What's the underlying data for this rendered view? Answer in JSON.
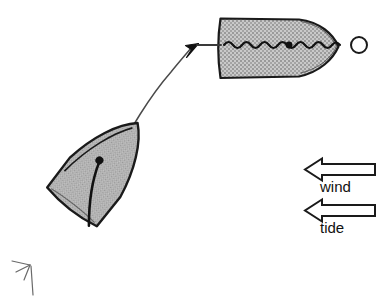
{
  "figure": {
    "type": "sailing-maneuver-diagram",
    "background_color": "#ffffff",
    "ink_color": "#1a1a1a",
    "hull_fill_color": "#b2b2b2",
    "hull_fill_texture": "dither-halftone-gray"
  },
  "boats": [
    {
      "id": "boat-start",
      "name": "dinghy-lower-left",
      "view": "plan",
      "heading_deg": 38,
      "position": {
        "x": 68,
        "y": 212
      },
      "length_px": 128,
      "beam_px": 62,
      "has_mast_dot": true,
      "has_boom_line": true,
      "has_rudder_wake": true
    },
    {
      "id": "boat-end",
      "name": "dinghy-upper-right",
      "view": "plan",
      "heading_deg": 0,
      "position": {
        "x": 278,
        "y": 48
      },
      "length_px": 120,
      "beam_px": 62,
      "has_mast_dot": true,
      "has_wavy_sail_line": true
    }
  ],
  "path": {
    "name": "maneuver-track",
    "style": "thin-curved-line",
    "arrowhead": "solid-filled",
    "from": {
      "x": 118,
      "y": 157
    },
    "to": {
      "x": 198,
      "y": 45
    },
    "tail_segment": {
      "x1": 198,
      "y1": 45,
      "x2": 220,
      "y2": 45
    }
  },
  "mark": {
    "name": "racing-mark-buoy",
    "shape": "circle-outline",
    "center": {
      "x": 359,
      "y": 45
    },
    "radius": 8
  },
  "legend": {
    "items": [
      {
        "id": "wind",
        "label": "wind",
        "arrow_direction": "left",
        "arrow_style": "hollow-outline",
        "x": 303,
        "y": 158,
        "width": 72,
        "height": 22
      },
      {
        "id": "tide",
        "label": "tide",
        "arrow_direction": "left",
        "arrow_style": "hollow-outline",
        "x": 303,
        "y": 199,
        "width": 72,
        "height": 22
      }
    ]
  }
}
